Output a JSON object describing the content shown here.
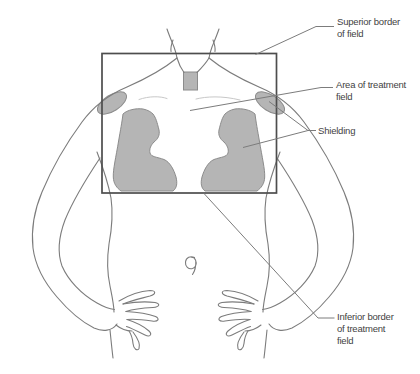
{
  "diagram": {
    "labels": {
      "superior_border": {
        "line1": "Superior border",
        "line2": "of field"
      },
      "treatment_area": {
        "line1": "Area of treatment",
        "line2": "field"
      },
      "shielding": {
        "text": "Shielding"
      },
      "inferior_border": {
        "line1": "Inferior border",
        "line2": "of treatment",
        "line3": "field"
      }
    },
    "colors": {
      "background": "#ffffff",
      "shield_fill": "#b5b5b5",
      "shield_stroke": "#8c8c8c",
      "body_outline": "#7c7c7c",
      "clavicle_line": "#c8c8c8",
      "field_border": "#4d4d4d",
      "leader_line": "#7c7c7c",
      "label_text": "#3f3f3f"
    }
  }
}
